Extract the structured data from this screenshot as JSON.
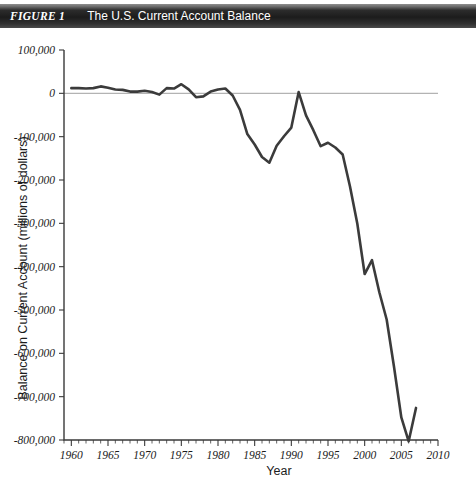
{
  "figure": {
    "number_label": "FIGURE 1",
    "title": "The U.S. Current Account Balance"
  },
  "chart_data": {
    "type": "line",
    "title": "The U.S. Current Account Balance",
    "xlabel": "Year",
    "ylabel": "Balance on Current Account (millions of dollars)",
    "xlim": [
      1959,
      2010
    ],
    "ylim": [
      -800000,
      100000
    ],
    "xticks": [
      1960,
      1965,
      1970,
      1975,
      1980,
      1985,
      1990,
      1995,
      2000,
      2005,
      2010
    ],
    "xtick_labels": [
      "1960",
      "1965",
      "1970",
      "1975",
      "1980",
      "1985",
      "1990",
      "1995",
      "2000",
      "2005",
      "2010"
    ],
    "x_minor_tick_step": 1,
    "yticks": [
      100000,
      0,
      -100000,
      -200000,
      -300000,
      -400000,
      -500000,
      -600000,
      -700000,
      -800000
    ],
    "ytick_labels": [
      "100,000",
      "0",
      "-100,000",
      "-200,000",
      "-300,000",
      "-400,000",
      "-500,000",
      "-600,000",
      "-700,000",
      "-800,000"
    ],
    "grid": false,
    "legend": null,
    "zero_reference_line": true,
    "line_color": "#3b3b3b",
    "zero_line_color": "#b3b3b3",
    "series": [
      {
        "name": "Balance on Current Account",
        "x": [
          1960,
          1961,
          1962,
          1963,
          1964,
          1965,
          1966,
          1967,
          1968,
          1969,
          1970,
          1971,
          1972,
          1973,
          1974,
          1975,
          1976,
          1977,
          1978,
          1979,
          1980,
          1981,
          1982,
          1983,
          1984,
          1985,
          1986,
          1987,
          1988,
          1989,
          1990,
          1991,
          1992,
          1993,
          1994,
          1995,
          1996,
          1997,
          1998,
          1999,
          2000,
          2001,
          2002,
          2003,
          2004,
          2005,
          2006,
          2007
        ],
        "values": [
          12000,
          12000,
          11000,
          12000,
          16000,
          13000,
          9000,
          8000,
          4000,
          4000,
          6000,
          3000,
          -3000,
          12000,
          11000,
          21000,
          9000,
          -9000,
          -7000,
          4000,
          9000,
          11000,
          -5000,
          -38000,
          -94000,
          -118000,
          -147000,
          -160000,
          -121000,
          -99000,
          -79000,
          3000,
          -51000,
          -85000,
          -122000,
          -114000,
          -125000,
          -141000,
          -215000,
          -301000,
          -417000,
          -385000,
          -459000,
          -522000,
          -631000,
          -748000,
          -803000,
          -726000
        ]
      }
    ]
  }
}
